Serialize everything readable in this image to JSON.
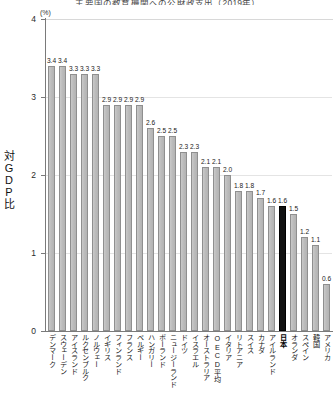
{
  "title": "主要国の教育機関への公財政支出（2019年）",
  "unit_label": "(%)",
  "y_axis_title": "対GDP比",
  "chart_data": {
    "type": "bar",
    "title": "主要国の教育機関への公財政支出（2019年）",
    "xlabel": "",
    "ylabel": "対GDP比",
    "unit": "%",
    "ylim": [
      0,
      4
    ],
    "yticks": [
      0,
      1,
      2,
      3,
      4
    ],
    "grid": true,
    "legend": "none",
    "highlight_category": "日本",
    "highlight_color": "#111111",
    "bar_color": "#bdbdbd",
    "categories": [
      "デンマーク",
      "スウェーデン",
      "アイスランド",
      "ルクセンブルク",
      "ノルウェー",
      "イギリス",
      "フィンランド",
      "フランス",
      "ベルギー",
      "ハンガリー",
      "ポーランド",
      "ニュージーランド",
      "ドイツ",
      "イスラエル",
      "オーストラリア",
      "OECD平均",
      "イタリア",
      "リトアニア",
      "スイス",
      "カナダ",
      "アイルランド",
      "日本",
      "オランダ",
      "スペイン",
      "韓国",
      "アメリカ"
    ],
    "values": [
      3.4,
      3.4,
      3.3,
      3.3,
      3.3,
      2.9,
      2.9,
      2.9,
      2.9,
      2.6,
      2.5,
      2.5,
      2.3,
      2.3,
      2.1,
      2.1,
      2.0,
      1.8,
      1.8,
      1.7,
      1.6,
      1.6,
      1.5,
      1.2,
      1.1,
      0.6
    ],
    "value_labels": [
      "3.4",
      "3.4",
      "3.3",
      "3.3",
      "3.3",
      "2.9",
      "2.9",
      "2.9",
      "2.9",
      "2.6",
      "2.5",
      "2.5",
      "2.3",
      "2.3",
      "2.1",
      "2.1",
      "2.0",
      "1.8",
      "1.8",
      "1.7",
      "1.6",
      "1.6",
      "1.5",
      "1.2",
      "1.1",
      "0.6"
    ]
  }
}
